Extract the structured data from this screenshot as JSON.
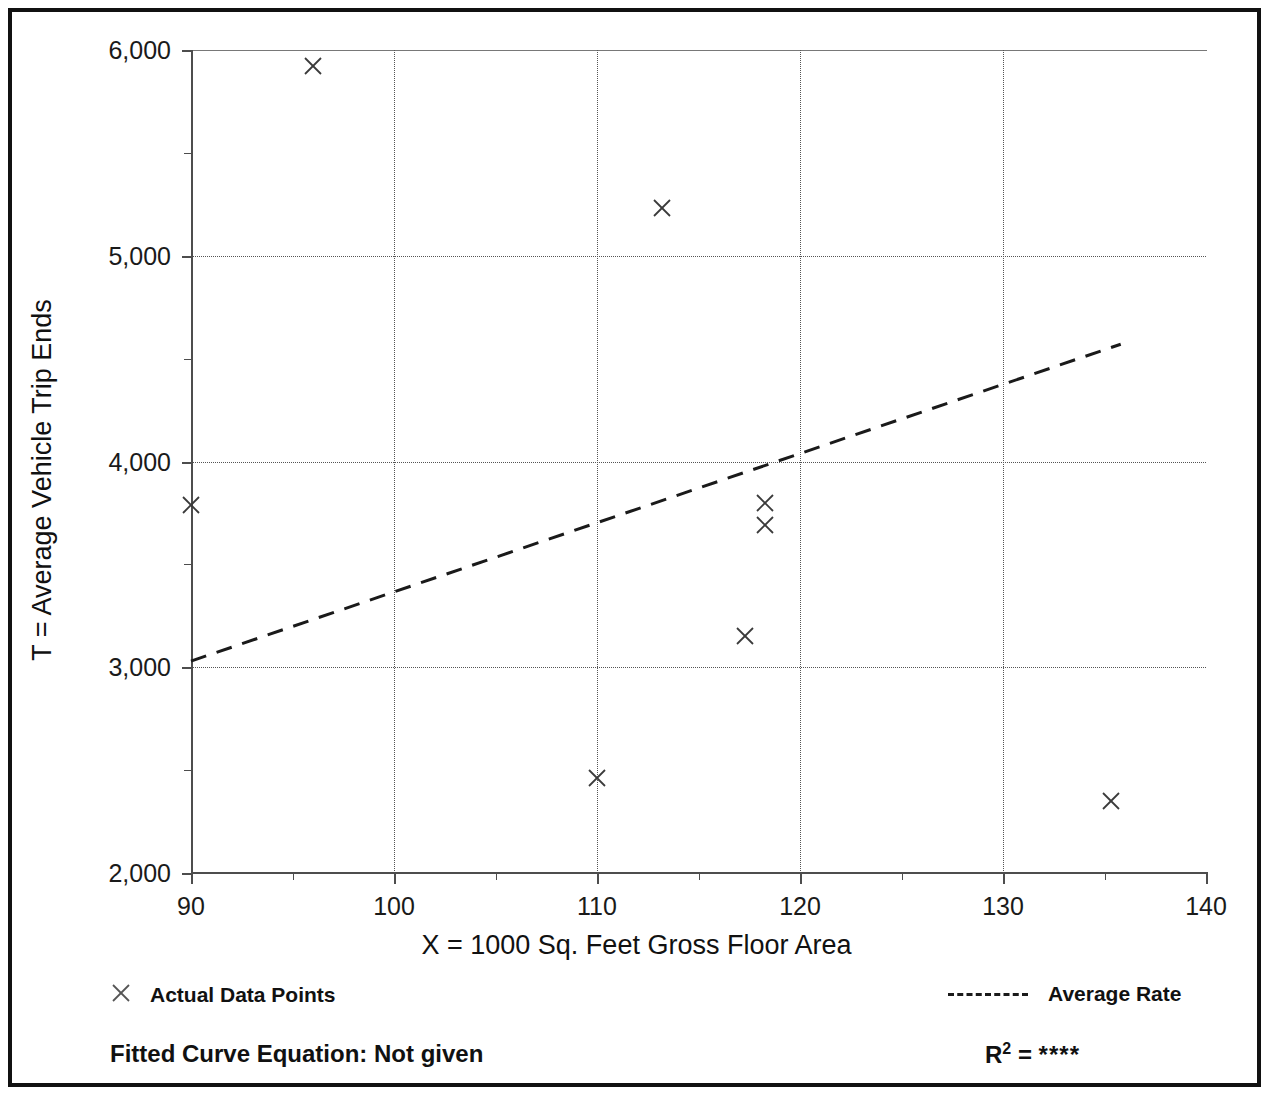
{
  "chart_data": {
    "type": "scatter",
    "title": "",
    "xlabel": "X = 1000 Sq. Feet Gross Floor Area",
    "ylabel": "T = Average Vehicle Trip Ends",
    "xlim": [
      90,
      140
    ],
    "ylim": [
      2000,
      6000
    ],
    "x_major_ticks": [
      90,
      100,
      110,
      120,
      130,
      140
    ],
    "x_minor_ticks": [
      95,
      105,
      115,
      125,
      135
    ],
    "y_major_ticks": [
      2000,
      3000,
      4000,
      5000,
      6000
    ],
    "y_minor_ticks": [
      2500,
      3500,
      4500,
      5500
    ],
    "x_tick_labels": [
      "90",
      "100",
      "110",
      "120",
      "130",
      "140"
    ],
    "y_tick_labels": [
      "2,000",
      "3,000",
      "4,000",
      "5,000",
      "6,000"
    ],
    "grid": "dotted vertical and horizontal at major ticks",
    "legend_position": "below plot, two columns",
    "series": [
      {
        "name": "Actual Data Points",
        "marker": "x",
        "points": [
          {
            "x": 96,
            "y": 5920
          },
          {
            "x": 113.2,
            "y": 5230
          },
          {
            "x": 90,
            "y": 3790
          },
          {
            "x": 118.3,
            "y": 3800
          },
          {
            "x": 118.3,
            "y": 3690
          },
          {
            "x": 117.3,
            "y": 3150
          },
          {
            "x": 110,
            "y": 2460
          },
          {
            "x": 135.3,
            "y": 2350
          }
        ]
      },
      {
        "name": "Average Rate",
        "style": "dashed-line",
        "points": [
          {
            "x": 90,
            "y": 3030
          },
          {
            "x": 135.8,
            "y": 4570
          }
        ]
      }
    ],
    "annotations": {
      "fitted_curve_equation": "Fitted Curve Equation:  Not given",
      "r_squared": "****"
    }
  },
  "axes": {
    "y_title": "T = Average Vehicle Trip Ends",
    "x_title": "X = 1000 Sq. Feet Gross Floor Area",
    "y_tick_labels": [
      "6,000",
      "5,000",
      "4,000",
      "3,000",
      "2,000"
    ],
    "x_tick_labels": [
      "90",
      "100",
      "110",
      "120",
      "130",
      "140"
    ]
  },
  "legend": {
    "data_points_label": "Actual Data Points",
    "average_rate_label": "Average Rate",
    "fitted_equation_label": "Fitted Curve Equation:  Not given",
    "r_label": "R",
    "r_exponent": "2",
    "r_equals": " = ",
    "r_value": "****"
  },
  "colors": {
    "frame": "#111111",
    "axis": "#4d4d4d",
    "grid": "#555555",
    "marker": "#3a3a3a",
    "trend": "#1a1a1a",
    "background": "#ffffff"
  }
}
